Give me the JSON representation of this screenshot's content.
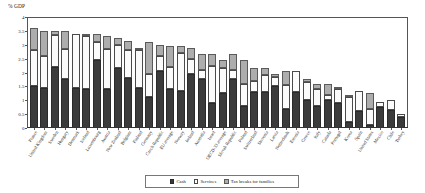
{
  "unit_label": "% GDP",
  "legend": {
    "items": [
      {
        "key": "cash",
        "label": "Cash"
      },
      {
        "key": "services",
        "label": "Services"
      },
      {
        "key": "tax",
        "label": "Tax breaks for families"
      }
    ]
  },
  "chart_data": {
    "type": "bar",
    "title": "",
    "subtitle": "",
    "xlabel": "",
    "ylabel": "% GDP",
    "ylim": [
      0,
      4
    ],
    "yticks": [
      "0",
      "0.5",
      "1",
      "1.5",
      "2",
      "2.5",
      "3",
      "3.5",
      "4"
    ],
    "grid": false,
    "stacked": true,
    "legend_position": "bottom",
    "categories": [
      "France",
      "United Kingdom",
      "Sweden",
      "Hungary",
      "Denmark",
      "Iceland",
      "Luxembourg",
      "Austria",
      "New Zealand",
      "Belgium",
      "Finland",
      "Germany",
      "Czech Republic",
      "EU average",
      "Norway",
      "Ireland",
      "Australia",
      "Israel",
      "OECD-33 average",
      "Slovak Republic",
      "Poland",
      "Switzerland",
      "Slovenia",
      "Latvia",
      "Netherlands",
      "Estonia",
      "Greece",
      "Italy",
      "Canada",
      "Portugal",
      "Korea",
      "Spain",
      "United States",
      "Mexico",
      "Chile",
      "Turkey"
    ],
    "series": [
      {
        "name": "Cash",
        "values": [
          1.5,
          1.45,
          2.2,
          1.75,
          1.45,
          1.4,
          2.45,
          1.4,
          2.15,
          1.8,
          1.45,
          1.1,
          2.05,
          1.4,
          1.35,
          1.95,
          1.75,
          0.9,
          1.25,
          1.75,
          0.8,
          1.3,
          1.3,
          1.5,
          0.7,
          1.3,
          1.0,
          0.8,
          1.0,
          0.9,
          0.2,
          0.6,
          0.1,
          0.75,
          0.65,
          0.4
        ]
      },
      {
        "name": "Services",
        "values": [
          1.3,
          1.15,
          1.15,
          1.1,
          1.95,
          1.9,
          0.65,
          1.45,
          0.85,
          1.0,
          1.35,
          0.85,
          0.55,
          0.8,
          1.35,
          0.55,
          0.35,
          1.35,
          0.9,
          0.35,
          0.8,
          0.4,
          0.6,
          0.35,
          0.85,
          0.75,
          0.65,
          0.6,
          0.2,
          0.5,
          0.9,
          0.75,
          0.6,
          0.2,
          0.35,
          0.1
        ]
      },
      {
        "name": "Tax breaks for families",
        "values": [
          0.8,
          0.9,
          0.15,
          0.65,
          0.0,
          0.05,
          0.3,
          0.45,
          0.25,
          0.35,
          0.1,
          1.15,
          0.4,
          0.75,
          0.25,
          0.4,
          0.55,
          0.4,
          0.3,
          0.55,
          0.85,
          0.45,
          0.25,
          0.1,
          0.5,
          0.0,
          0.1,
          0.2,
          0.4,
          0.05,
          0.1,
          0.0,
          0.55,
          0.0,
          0.0,
          0.0
        ]
      }
    ]
  }
}
